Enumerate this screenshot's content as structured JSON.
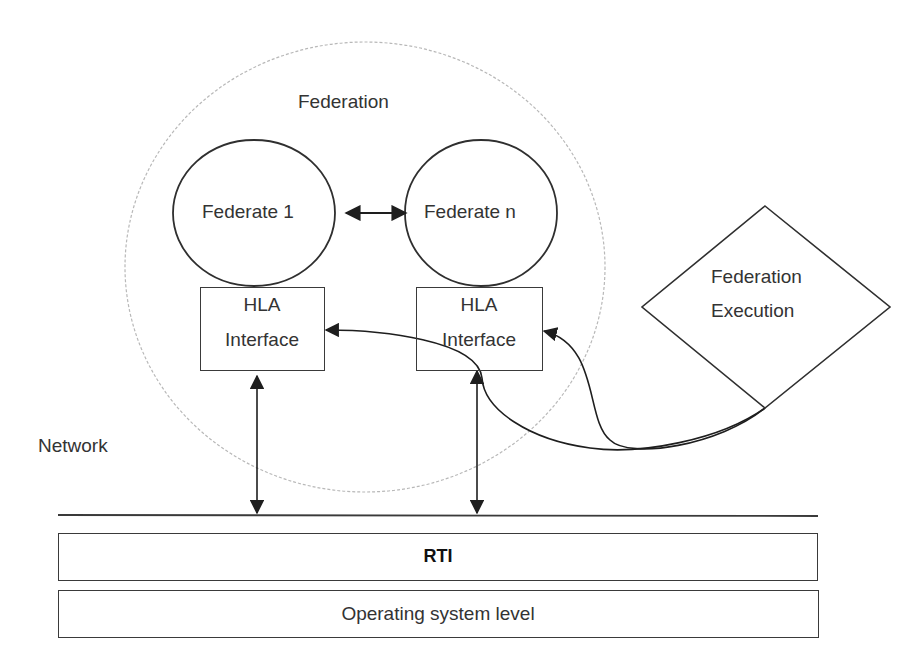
{
  "diagram": {
    "federation": {
      "label": "Federation"
    },
    "federates": [
      {
        "label": "Federate 1"
      },
      {
        "label": "Federate n"
      }
    ],
    "interfaces": [
      {
        "line1": "HLA",
        "line2": "Interface"
      },
      {
        "line1": "HLA",
        "line2": "Interface"
      }
    ],
    "execution": {
      "line1": "Federation",
      "line2": "Execution"
    },
    "network": {
      "label": "Network"
    },
    "layers": [
      {
        "label": "RTI",
        "bold": true
      },
      {
        "label": "Operating system level",
        "bold": false
      }
    ],
    "colors": {
      "stroke": "#2b2b2b",
      "dotted_circle": "#b5b5b5",
      "background": "#ffffff"
    }
  }
}
